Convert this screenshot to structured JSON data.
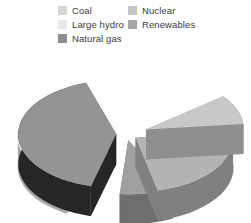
{
  "legend": {
    "columns": [
      {
        "name": "legend-column-left",
        "items": [
          {
            "label": "Coal",
            "color": "#d6d6d6",
            "key": "coal"
          },
          {
            "label": "Large hydro",
            "color": "#e8e8e8",
            "key": "large-hydro"
          },
          {
            "label": "Natural gas",
            "color": "#8c8c8c",
            "key": "natural-gas"
          }
        ]
      },
      {
        "name": "legend-column-right",
        "items": [
          {
            "label": "Nuclear",
            "color": "#c6c6c6",
            "key": "nuclear"
          },
          {
            "label": "Renewables",
            "color": "#a6a6a6",
            "key": "renewables"
          }
        ]
      }
    ]
  },
  "chart_data": {
    "type": "pie",
    "title": "",
    "subtitle": "",
    "xlabel": "",
    "ylabel": "",
    "style": "exploded-3d",
    "legend_position": "top",
    "grid": false,
    "categories": [
      "Natural gas",
      "Coal",
      "Nuclear",
      "Renewables",
      "Large hydro"
    ],
    "values": [
      41,
      23,
      9,
      9,
      18
    ],
    "unit": "percent",
    "series": [
      {
        "name": "Electricity generation share",
        "slices": [
          {
            "label": "Natural gas",
            "value": 41,
            "top_color": "#949494",
            "side_color": "#262626",
            "start_angle": 105,
            "end_angle": 252,
            "explode": 0.1
          },
          {
            "label": "Coal",
            "value": 23,
            "top_color": "#b4b4b4",
            "side_color": "#808080",
            "start_angle": 354,
            "end_angle": 437,
            "explode": 0.12
          },
          {
            "label": "Nuclear",
            "value": 9,
            "top_color": "#c8c8c8",
            "side_color": "#8f8f8f",
            "start_angle": 322,
            "end_angle": 354,
            "explode": 0.22
          },
          {
            "label": "Renewables",
            "value": 9,
            "top_color": "#a0a0a0",
            "side_color": "#6e6e6e",
            "start_angle": 63,
            "end_angle": 95,
            "explode": 0.12
          },
          {
            "label": "Large hydro",
            "value": 18,
            "top_color": "#e3e3e3",
            "side_color": "#a8a8a8",
            "start_angle": 120,
            "end_angle": 185,
            "explode": 0.12
          }
        ]
      }
    ]
  }
}
